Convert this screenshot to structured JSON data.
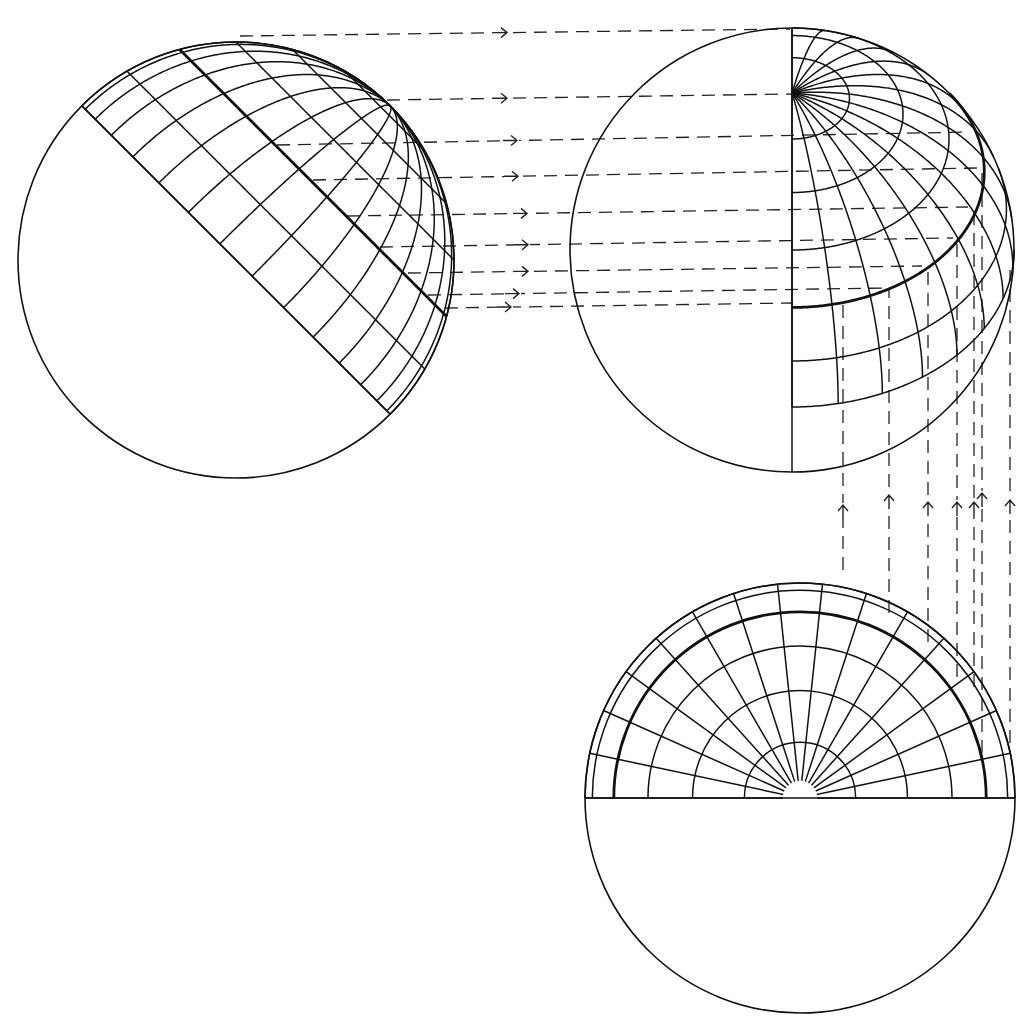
{
  "diagram": {
    "title": "Orthographic projection of a hemispherical grid in three views",
    "canvas": {
      "width": 1033,
      "height": 1031,
      "background": "#ffffff",
      "ink": "#111111"
    },
    "grid": {
      "latitudes_deg": [
        0,
        15,
        30,
        45,
        60,
        75
      ],
      "thick_latitude_deg": 30,
      "longitude_step_deg": 12
    },
    "views": {
      "left": {
        "label": "auxiliary side view (equator seen edge-on)",
        "center": [
          236,
          260
        ],
        "radius": 218,
        "equator_angle_deg": 45,
        "longitude_range_deg": [
          -90,
          90
        ]
      },
      "right": {
        "label": "front elevation (pole tilted 45 degrees)",
        "center": [
          792,
          250
        ],
        "radius": 222,
        "tilt_deg": 45,
        "longitude_range_deg": [
          -90,
          90
        ]
      },
      "bottom": {
        "label": "plan view (polar)",
        "center": [
          800,
          798
        ],
        "radius": 215,
        "longitude_range_deg": [
          0,
          180
        ]
      }
    },
    "projection_lines": {
      "horizontal": [
        {
          "x1": 240,
          "y1": 36,
          "x2": 790,
          "y2": 29,
          "arrow_x": 507
        },
        {
          "x1": 387,
          "y1": 100,
          "x2": 792,
          "y2": 94,
          "arrow_x": 507
        },
        {
          "x1": 277,
          "y1": 145,
          "x2": 970,
          "y2": 132,
          "arrow_x": 517
        },
        {
          "x1": 313,
          "y1": 180,
          "x2": 977,
          "y2": 168,
          "arrow_x": 518
        },
        {
          "x1": 347,
          "y1": 216,
          "x2": 968,
          "y2": 207,
          "arrow_x": 527
        },
        {
          "x1": 380,
          "y1": 247,
          "x2": 953,
          "y2": 238,
          "arrow_x": 528
        },
        {
          "x1": 408,
          "y1": 273,
          "x2": 922,
          "y2": 266,
          "arrow_x": 528
        },
        {
          "x1": 428,
          "y1": 295,
          "x2": 885,
          "y2": 288,
          "arrow_x": 519
        },
        {
          "x1": 445,
          "y1": 308,
          "x2": 793,
          "y2": 303,
          "arrow_x": 511
        }
      ],
      "vertical": [
        {
          "x": 843,
          "y_top": 303,
          "y_bottom": 570,
          "arrow_y": 505
        },
        {
          "x": 889,
          "y_top": 289,
          "y_bottom": 613,
          "arrow_y": 495
        },
        {
          "x": 928,
          "y_top": 266,
          "y_bottom": 642,
          "arrow_y": 502
        },
        {
          "x": 957,
          "y_top": 238,
          "y_bottom": 677,
          "arrow_y": 502
        },
        {
          "x": 974,
          "y_top": 207,
          "y_bottom": 687,
          "arrow_y": 502
        },
        {
          "x": 982,
          "y_top": 167,
          "y_bottom": 753,
          "arrow_y": 493
        },
        {
          "x": 1010,
          "y_top": 270,
          "y_bottom": 743,
          "arrow_y": 500
        }
      ]
    },
    "icons": {
      "horizontal_arrow": "arrow-right",
      "vertical_arrow": "arrow-up"
    }
  }
}
